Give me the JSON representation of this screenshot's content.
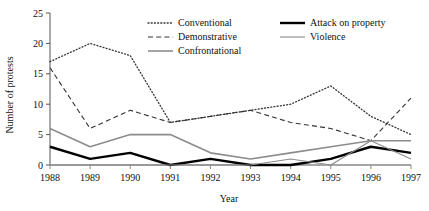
{
  "chart_data": {
    "type": "line",
    "title": "",
    "xlabel": "Year",
    "ylabel": "Number of protests",
    "categories": [
      "1988",
      "1989",
      "1990",
      "1991",
      "1992",
      "1993",
      "1994",
      "1995",
      "1996",
      "1997"
    ],
    "x": [
      1988,
      1989,
      1990,
      1991,
      1992,
      1993,
      1994,
      1995,
      1996,
      1997
    ],
    "xlim": [
      1988,
      1997
    ],
    "ylim": [
      0,
      25
    ],
    "yticks": [
      0,
      5,
      10,
      15,
      20,
      25
    ],
    "ytick_labels": [
      "0",
      "5",
      "10",
      "15",
      "20",
      "25"
    ],
    "xtick_labels": [
      "1988",
      "1989",
      "1990",
      "1991",
      "1992",
      "1993",
      "1994",
      "1995",
      "1996",
      "1997"
    ],
    "grid": false,
    "legend_position": "top-center",
    "series": [
      {
        "name": "Conventional",
        "style": "dotted",
        "color": "#333333",
        "values": [
          17,
          20,
          18,
          7,
          8,
          9,
          10,
          13,
          8,
          5
        ]
      },
      {
        "name": "Demonstrative",
        "style": "dashed",
        "color": "#333333",
        "values": [
          16,
          6,
          9,
          7,
          8,
          9,
          7,
          6,
          4,
          11
        ]
      },
      {
        "name": "Confrontational",
        "style": "solid-gray",
        "color": "#8c8c8c",
        "values": [
          6,
          3,
          5,
          5,
          2,
          1,
          2,
          3,
          4,
          4
        ]
      },
      {
        "name": "Attack on property",
        "style": "solid-thick-black",
        "color": "#000000",
        "values": [
          3,
          1,
          2,
          0,
          1,
          0,
          0,
          1,
          3,
          2
        ]
      },
      {
        "name": "Violence",
        "style": "solid-thin-gray",
        "color": "#8c8c8c",
        "values": [
          0,
          0,
          0,
          0,
          0,
          0,
          1,
          0,
          4,
          1
        ]
      }
    ]
  }
}
